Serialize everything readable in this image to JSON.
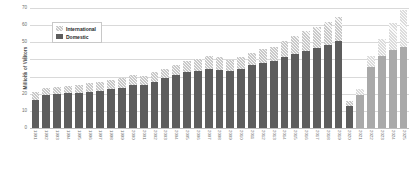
{
  "chart_data": {
    "type": "bar",
    "title": "",
    "subtitle": "",
    "xlabel": "",
    "ylabel": "Millions of Visitors",
    "ylim": [
      0,
      70
    ],
    "yticks": [
      0,
      10,
      20,
      30,
      40,
      50,
      60,
      70
    ],
    "grid": true,
    "stacked": true,
    "legend_position": "top-left-inside",
    "legend": [
      "International",
      "Domestic"
    ],
    "categories": [
      "1991",
      "1992",
      "1993",
      "1994",
      "1995",
      "1996",
      "1997",
      "1998",
      "1999",
      "2000",
      "2001",
      "2002",
      "2003",
      "2004",
      "2005",
      "2006",
      "2007",
      "2008",
      "2009",
      "2010",
      "2011",
      "2012",
      "2013",
      "2014",
      "2015",
      "2016",
      "2017",
      "2018",
      "2019",
      "2020",
      "2021",
      "2022",
      "2023",
      "2024",
      "2025"
    ],
    "series": [
      {
        "name": "Domestic",
        "color": "#5d5d5d",
        "values": [
          16.5,
          19.5,
          20.0,
          20.5,
          20.5,
          21.0,
          21.5,
          22.5,
          23.5,
          25.0,
          25.0,
          27.0,
          29.0,
          31.0,
          32.5,
          33.5,
          34.5,
          34.0,
          33.0,
          34.5,
          36.5,
          38.0,
          39.0,
          41.5,
          43.0,
          45.0,
          46.5,
          48.5,
          50.5,
          13.0,
          19.5,
          35.5,
          42.0,
          45.5,
          47.5
        ]
      },
      {
        "name": "International",
        "color": "#c9c9c9",
        "values": [
          4.5,
          4.0,
          4.0,
          4.0,
          4.5,
          5.0,
          5.5,
          5.5,
          5.5,
          6.0,
          5.5,
          5.5,
          5.5,
          6.0,
          6.5,
          7.0,
          7.5,
          7.5,
          6.5,
          7.0,
          7.5,
          8.0,
          8.5,
          9.5,
          10.5,
          11.5,
          12.5,
          13.5,
          14.0,
          2.5,
          3.5,
          6.5,
          10.0,
          15.5,
          21.5
        ]
      }
    ],
    "forecast_from": "2021",
    "forecast_note": "lighter shaded bars"
  },
  "legend": {
    "international_label": "International",
    "domestic_label": "Domestic"
  },
  "axes": {
    "y_title": "Millions of Visitors"
  }
}
